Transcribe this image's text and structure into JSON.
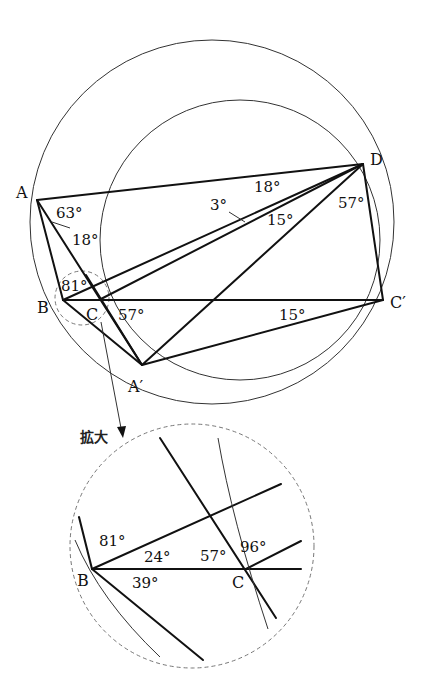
{
  "main_figure": {
    "points": {
      "A": {
        "label": "A",
        "x": 37,
        "y": 200
      },
      "D": {
        "label": "D",
        "x": 363,
        "y": 164
      },
      "B": {
        "label": "B",
        "x": 63,
        "y": 300
      },
      "C": {
        "label": "C",
        "x": 99,
        "y": 300
      },
      "C_prime": {
        "label": "C′",
        "x": 383,
        "y": 300
      },
      "A_prime": {
        "label": "A′",
        "x": 142,
        "y": 365
      }
    },
    "angles": {
      "a63": "63°",
      "a18_at_A": "18°",
      "a81": "81°",
      "a57_at_C": "57°",
      "a3": "3°",
      "a18_at_D": "18°",
      "a15_at_D": "15°",
      "a57_at_D": "57°",
      "a15_at_Cprime": "15°"
    }
  },
  "zoom_callout": {
    "label": "拡大",
    "points": {
      "B": {
        "label": "B"
      },
      "C": {
        "label": "C"
      }
    },
    "angles": {
      "a81": "81°",
      "a24": "24°",
      "a39": "39°",
      "a57": "57°",
      "a96": "96°"
    }
  }
}
